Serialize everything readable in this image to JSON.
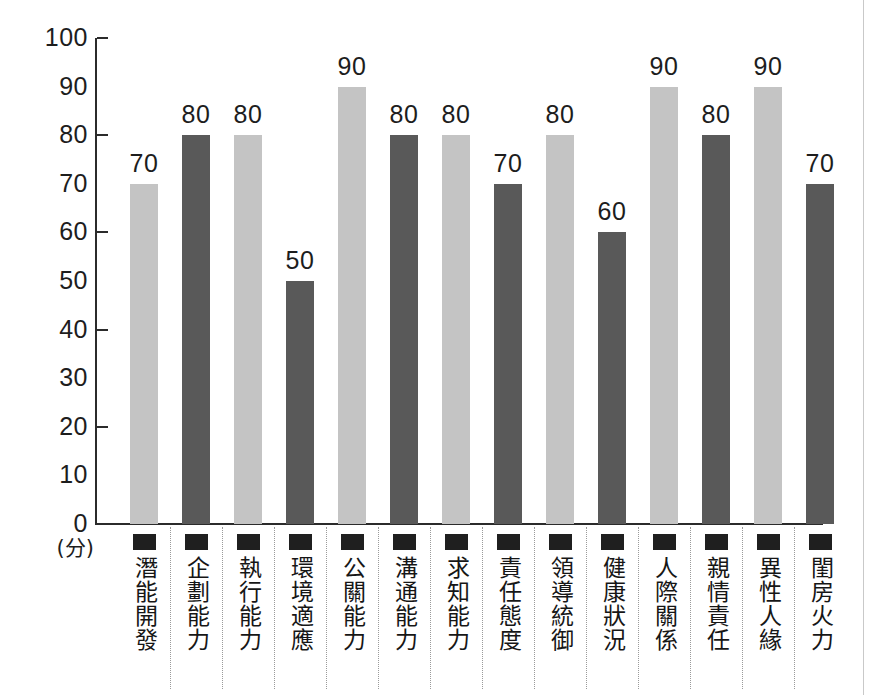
{
  "chart_data": {
    "type": "bar",
    "title": "",
    "xlabel": "",
    "ylabel": "(分)",
    "ylim": [
      0,
      100
    ],
    "ytick_step": 10,
    "yticks": [
      0,
      10,
      20,
      30,
      40,
      50,
      60,
      70,
      80,
      90,
      100
    ],
    "ytick_labels": [
      "0",
      "10",
      "20",
      "30",
      "40",
      "50",
      "60",
      "70",
      "80",
      "90",
      "100"
    ],
    "major_tick_values": [
      20,
      40,
      60,
      80,
      100
    ],
    "grid": false,
    "legend": "none",
    "value_labels_shown": true,
    "bar_colors": {
      "light": "#c4c4c4",
      "dark": "#595959",
      "pattern": "alternating light/dark starting with light"
    },
    "axis_color": "#2b2b2b",
    "categories": [
      "潛能開發",
      "企劃能力",
      "執行能力",
      "環境適應",
      "公關能力",
      "溝通能力",
      "求知能力",
      "責任態度",
      "領導統御",
      "健康狀況",
      "人際關係",
      "親情責任",
      "異性人緣",
      "閨房火力"
    ],
    "values": [
      70,
      80,
      80,
      50,
      90,
      80,
      80,
      70,
      80,
      60,
      90,
      80,
      90,
      70
    ],
    "value_label_texts": [
      "70",
      "80",
      "80",
      "50",
      "90",
      "80",
      "80",
      "70",
      "80",
      "60",
      "90",
      "80",
      "90",
      "70"
    ],
    "bar_shades": [
      "light",
      "dark",
      "light",
      "dark",
      "light",
      "dark",
      "light",
      "dark",
      "light",
      "dark",
      "light",
      "dark",
      "light",
      "dark"
    ],
    "category_marker": "filled-square"
  }
}
